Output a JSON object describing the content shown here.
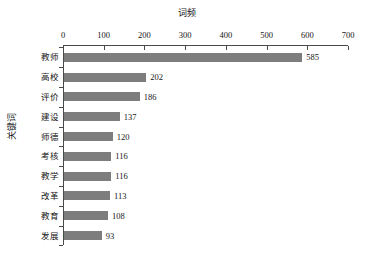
{
  "chart_data": {
    "type": "bar",
    "orientation": "horizontal",
    "title": "词频",
    "xlabel": "词频",
    "ylabel": "关键词",
    "categories": [
      "教师",
      "高校",
      "评价",
      "建设",
      "师德",
      "考核",
      "教学",
      "改革",
      "教育",
      "发展"
    ],
    "values": [
      585,
      202,
      186,
      137,
      120,
      116,
      116,
      113,
      108,
      93
    ],
    "value_labels": [
      "585",
      "202",
      "186",
      "137",
      "120",
      "116",
      "116",
      "113",
      "108",
      "93"
    ],
    "xlim": [
      0,
      700
    ],
    "xticks": [
      0,
      100,
      200,
      300,
      400,
      500,
      600,
      700
    ],
    "xtick_labels": [
      "0",
      "100",
      "200",
      "300",
      "400",
      "500",
      "600",
      "700"
    ],
    "grid": false,
    "legend": null,
    "xaxis_position": "top",
    "bar_color": "#7d7d7d",
    "axis_color": "#4a4a4a",
    "text_color": "#161616",
    "background": "#ffffff"
  }
}
